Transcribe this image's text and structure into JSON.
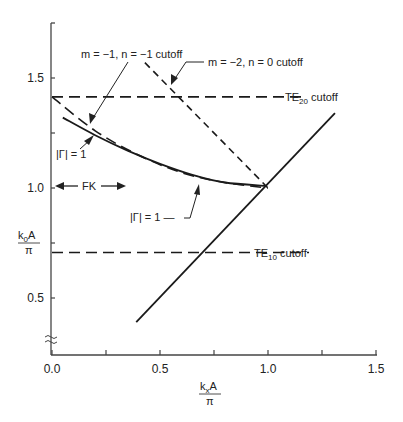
{
  "chart_data": {
    "type": "line",
    "title": "",
    "xlabel": {
      "num_main": "k",
      "num_sub": "x",
      "num_tail": "A",
      "den": "π"
    },
    "ylabel": {
      "num_main": "k",
      "num_sub": "0",
      "num_tail": "A",
      "den": "π"
    },
    "xlim": [
      0.0,
      1.5
    ],
    "ylim": [
      0.25,
      1.75
    ],
    "y_axis_break": true,
    "grid": false,
    "xticks": [
      0.0,
      0.25,
      0.5,
      0.75,
      1.0,
      1.25,
      1.5
    ],
    "xtick_labels": [
      {
        "value": 0.0,
        "label": "0.0"
      },
      {
        "value": 0.5,
        "label": "0.5"
      },
      {
        "value": 1.0,
        "label": "1.0"
      },
      {
        "value": 1.5,
        "label": "1.5"
      }
    ],
    "yticks": [
      0.5,
      0.75,
      1.0,
      1.25,
      1.5
    ],
    "ytick_labels": [
      {
        "value": 0.5,
        "label": "0.5"
      },
      {
        "value": 1.0,
        "label": "1.0"
      },
      {
        "value": 1.5,
        "label": "1.5"
      }
    ],
    "series": [
      {
        "name": "TE20 cutoff",
        "style": "dashed",
        "x": [
          0.0,
          1.18
        ],
        "y": [
          1.414,
          1.414
        ]
      },
      {
        "name": "TE10 cutoff",
        "style": "dashed",
        "x": [
          0.0,
          1.19
        ],
        "y": [
          0.707,
          0.707
        ]
      },
      {
        "name": "m = -1, n = -1 cutoff",
        "style": "dashed",
        "x": [
          0.0,
          0.2,
          0.4,
          0.6,
          0.8,
          1.0
        ],
        "y": [
          1.414,
          1.26,
          1.15,
          1.07,
          1.025,
          1.0
        ]
      },
      {
        "name": "m = -2, n = 0 cutoff",
        "style": "dashed",
        "x": [
          0.43,
          1.0
        ],
        "y": [
          1.57,
          1.0
        ]
      },
      {
        "name": "|Γ| = 1",
        "style": "solid",
        "x": [
          0.05,
          0.2,
          0.35,
          0.5,
          0.65,
          0.8,
          0.99
        ],
        "y": [
          1.32,
          1.24,
          1.17,
          1.11,
          1.06,
          1.025,
          1.01
        ]
      },
      {
        "name": "light line (k0 = kx)",
        "style": "solid",
        "x": [
          0.39,
          1.31
        ],
        "y": [
          0.39,
          1.34
        ]
      }
    ],
    "annotations": [
      {
        "id": "m1n1",
        "text": "m = −1, n = −1 cutoff",
        "points_to": {
          "x": 0.17,
          "y": 1.28
        }
      },
      {
        "id": "m2n0",
        "text": "m = −2, n = 0 cutoff",
        "points_to": {
          "x": 0.55,
          "y": 1.45
        }
      },
      {
        "id": "te20",
        "text_main": "TE",
        "text_sub": "20",
        "text_tail": " cutoff"
      },
      {
        "id": "te10",
        "text_main": "TE",
        "text_sub": "10",
        "text_tail": " cutoff"
      },
      {
        "id": "gamma_upper",
        "text": "|Γ| = 1",
        "points_to": {
          "x": 0.18,
          "y": 1.24
        }
      },
      {
        "id": "gamma_lower",
        "text": "|Γ| = 1 —",
        "points_to": {
          "x": 0.58,
          "y": 1.05
        }
      },
      {
        "id": "fk",
        "text": "FK",
        "range_x": [
          0.0,
          0.5
        ],
        "at_y": 1.0
      }
    ]
  }
}
